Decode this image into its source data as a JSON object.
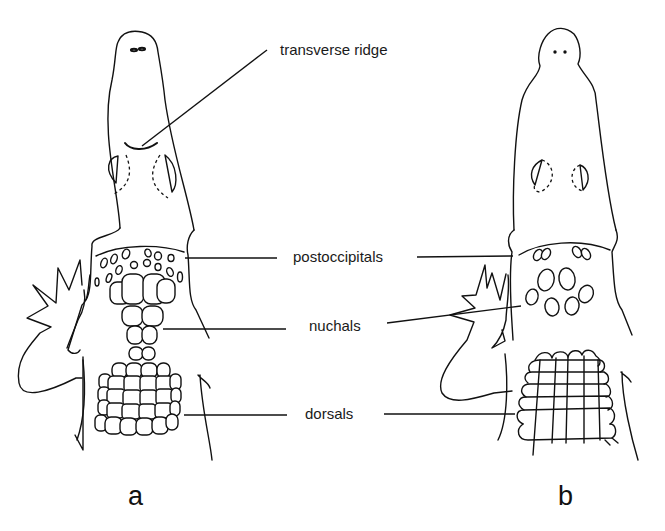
{
  "figure": {
    "type": "labeled anatomical line drawing",
    "panels": [
      {
        "id": "a",
        "label": "a"
      },
      {
        "id": "b",
        "label": "b"
      }
    ],
    "labels": {
      "transverse_ridge": "transverse ridge",
      "postoccipitals": "postoccipitals",
      "nuchals": "nuchals",
      "dorsals": "dorsals"
    },
    "colors": {
      "ink": "#111111",
      "background": "#ffffff"
    }
  }
}
